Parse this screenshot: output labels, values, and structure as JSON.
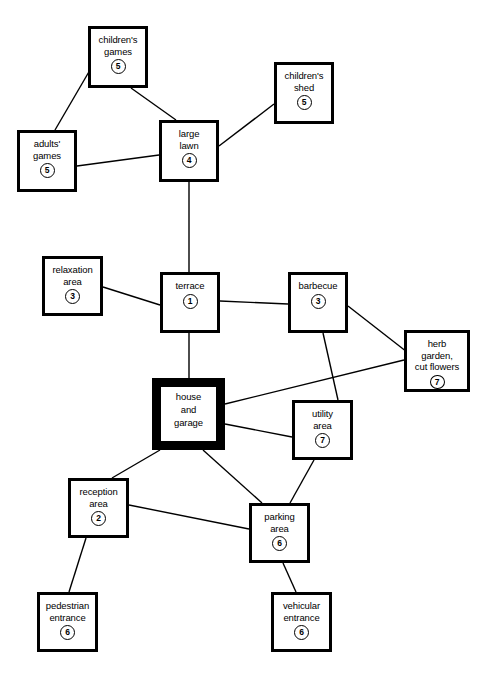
{
  "diagram": {
    "type": "node-link-graph",
    "title": "",
    "background_color": "#ffffff",
    "line_color": "#000000",
    "node_border_color": "#000000",
    "nodes": [
      {
        "id": "childrens-games",
        "label": "children's\ngames",
        "number": "5",
        "x": 88,
        "y": 26,
        "w": 60,
        "h": 62,
        "emphasis": false
      },
      {
        "id": "childrens-shed",
        "label": "children's\nshed",
        "number": "5",
        "x": 274,
        "y": 62,
        "w": 60,
        "h": 62,
        "emphasis": false
      },
      {
        "id": "adults-games",
        "label": "adults'\ngames",
        "number": "5",
        "x": 17,
        "y": 130,
        "w": 60,
        "h": 62,
        "emphasis": false
      },
      {
        "id": "large-lawn",
        "label": "large\nlawn",
        "number": "4",
        "x": 159,
        "y": 120,
        "w": 60,
        "h": 62,
        "emphasis": false
      },
      {
        "id": "relaxation-area",
        "label": "relaxation\narea",
        "number": "3",
        "x": 42,
        "y": 256,
        "w": 61,
        "h": 60,
        "emphasis": false
      },
      {
        "id": "terrace",
        "label": "terrace",
        "number": "1",
        "x": 160,
        "y": 272,
        "w": 60,
        "h": 61,
        "emphasis": false
      },
      {
        "id": "barbecue",
        "label": "barbecue",
        "number": "3",
        "x": 288,
        "y": 272,
        "w": 60,
        "h": 61,
        "emphasis": false
      },
      {
        "id": "herb-garden",
        "label": "herb\ngarden,\ncut flowers",
        "number": "7",
        "x": 404,
        "y": 330,
        "w": 66,
        "h": 62,
        "emphasis": false
      },
      {
        "id": "house-and-garage",
        "label": "house\nand\ngarage",
        "number": "",
        "x": 152,
        "y": 378,
        "w": 73,
        "h": 72,
        "emphasis": true
      },
      {
        "id": "utility-area",
        "label": "utility\narea",
        "number": "7",
        "x": 292,
        "y": 400,
        "w": 61,
        "h": 60,
        "emphasis": false
      },
      {
        "id": "reception-area",
        "label": "reception\narea",
        "number": "2",
        "x": 68,
        "y": 478,
        "w": 61,
        "h": 60,
        "emphasis": false
      },
      {
        "id": "parking-area",
        "label": "parking\narea",
        "number": "6",
        "x": 249,
        "y": 503,
        "w": 61,
        "h": 60,
        "emphasis": false
      },
      {
        "id": "pedestrian-entrance",
        "label": "pedestrian\nentrance",
        "number": "6",
        "x": 37,
        "y": 592,
        "w": 61,
        "h": 60,
        "emphasis": false
      },
      {
        "id": "vehicular-entrance",
        "label": "vehicular\nentrance",
        "number": "6",
        "x": 271,
        "y": 592,
        "w": 61,
        "h": 60,
        "emphasis": false
      }
    ],
    "edges": [
      {
        "from": "childrens-games",
        "to": "adults-games",
        "x1": 90,
        "y1": 70,
        "x2": 55,
        "y2": 130
      },
      {
        "from": "childrens-games",
        "to": "large-lawn",
        "x1": 131,
        "y1": 88,
        "x2": 176,
        "y2": 120
      },
      {
        "from": "adults-games",
        "to": "large-lawn",
        "x1": 77,
        "y1": 166,
        "x2": 159,
        "y2": 155
      },
      {
        "from": "large-lawn",
        "to": "childrens-shed",
        "x1": 219,
        "y1": 146,
        "x2": 274,
        "y2": 104
      },
      {
        "from": "large-lawn",
        "to": "terrace",
        "x1": 189,
        "y1": 182,
        "x2": 189,
        "y2": 272
      },
      {
        "from": "relaxation-area",
        "to": "terrace",
        "x1": 103,
        "y1": 287,
        "x2": 160,
        "y2": 305
      },
      {
        "from": "terrace",
        "to": "barbecue",
        "x1": 220,
        "y1": 301,
        "x2": 288,
        "y2": 304
      },
      {
        "from": "terrace",
        "to": "house-and-garage",
        "x1": 189,
        "y1": 333,
        "x2": 189,
        "y2": 378
      },
      {
        "from": "barbecue",
        "to": "herb-garden",
        "x1": 348,
        "y1": 306,
        "x2": 407,
        "y2": 352
      },
      {
        "from": "barbecue",
        "to": "utility-area",
        "x1": 323,
        "y1": 333,
        "x2": 338,
        "y2": 400
      },
      {
        "from": "house-and-garage",
        "to": "herb-garden",
        "x1": 225,
        "y1": 404,
        "x2": 404,
        "y2": 360
      },
      {
        "from": "house-and-garage",
        "to": "utility-area",
        "x1": 225,
        "y1": 424,
        "x2": 292,
        "y2": 437
      },
      {
        "from": "house-and-garage",
        "to": "reception-area",
        "x1": 160,
        "y1": 450,
        "x2": 112,
        "y2": 478
      },
      {
        "from": "house-and-garage",
        "to": "parking-area",
        "x1": 203,
        "y1": 450,
        "x2": 262,
        "y2": 503
      },
      {
        "from": "utility-area",
        "to": "parking-area",
        "x1": 314,
        "y1": 460,
        "x2": 290,
        "y2": 503
      },
      {
        "from": "reception-area",
        "to": "parking-area",
        "x1": 129,
        "y1": 505,
        "x2": 249,
        "y2": 529
      },
      {
        "from": "reception-area",
        "to": "pedestrian-entrance",
        "x1": 86,
        "y1": 538,
        "x2": 69,
        "y2": 592
      },
      {
        "from": "parking-area",
        "to": "vehicular-entrance",
        "x1": 283,
        "y1": 563,
        "x2": 296,
        "y2": 592
      }
    ]
  }
}
